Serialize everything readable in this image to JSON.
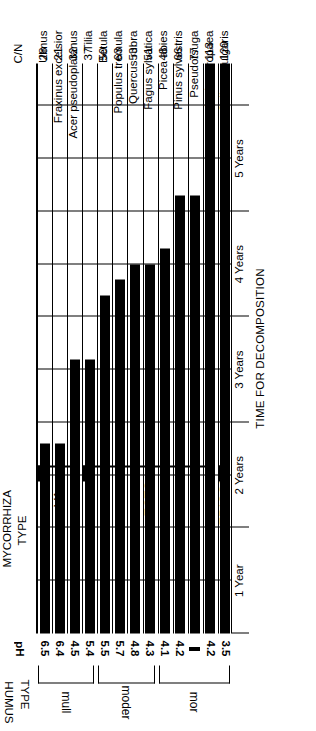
{
  "figure": {
    "humus_header_line1": "HUMUS",
    "humus_header_line2": "TYPE",
    "ph_header": "pH",
    "cn_header": "C/N",
    "mycorrhiza_header_line1": "MYCORRHIZA",
    "mycorrhiza_header_line2": "TYPE",
    "axis_title": "TIME FOR DECOMPOSITION"
  },
  "axis": {
    "ticks": [
      "1 Year",
      "2 Years",
      "3 Years",
      "4 Years",
      "5 Years"
    ],
    "min": 0,
    "max": 5,
    "unit": "Years"
  },
  "humus_groups": [
    {
      "label": "mull",
      "first": 0,
      "last": 3
    },
    {
      "label": "moder",
      "first": 4,
      "last": 7
    },
    {
      "label": "mor",
      "first": 8,
      "last": 12
    }
  ],
  "mycorrhiza_groups": [
    {
      "label": "VA",
      "first": 0,
      "last": 2
    },
    {
      "label": "ECTO",
      "first": 3,
      "last": 11
    },
    {
      "label": "ERICOID",
      "first": 12,
      "last": 12
    }
  ],
  "chart_data": {
    "type": "bar",
    "orientation": "horizontal",
    "title": "",
    "xlabel": "TIME FOR DECOMPOSITION",
    "ylabel": "",
    "xlim": [
      0,
      5.4
    ],
    "grid": true,
    "legend": "none",
    "categories": [
      "Ulmus",
      "Fraxinus excelsior",
      "Acer pseudoplatanus",
      "Tilia",
      "Betula",
      "Populus tremula",
      "Quercus rubra",
      "Fagus sylvatica",
      "Picea abies",
      "Pinus sylvestris",
      "Pseudotsuga",
      "Larix europaea",
      "Calluna vulgaris"
    ],
    "values": [
      1.8,
      1.8,
      2.6,
      2.6,
      3.2,
      3.35,
      3.5,
      3.5,
      3.65,
      4.15,
      4.15,
      5.4,
      5.4
    ],
    "series": [
      {
        "name": "Time for decomposition (years)",
        "values": [
          1.8,
          1.8,
          2.6,
          2.6,
          3.2,
          3.35,
          3.5,
          3.5,
          3.65,
          4.15,
          4.15,
          5.4,
          5.4
        ]
      }
    ],
    "cn_ratio": [
      28,
      21,
      32,
      37,
      50,
      63,
      53,
      51,
      48,
      66,
      77,
      113,
      120
    ],
    "ph": [
      "6.5",
      "6.4",
      "4.5",
      "5.4",
      "5.5",
      "5.7",
      "4.8",
      "4.3",
      "4.1",
      "4.2",
      "–",
      "4.2",
      "3.5"
    ],
    "humus_type": [
      "mull",
      "mull",
      "mull",
      "mull",
      "moder",
      "moder",
      "moder",
      "moder",
      "mor",
      "mor",
      "mor",
      "mor",
      "mor"
    ],
    "mycorrhiza_type": [
      "VA",
      "VA",
      "VA",
      "ECTO",
      "ECTO",
      "ECTO",
      "ECTO",
      "ECTO",
      "ECTO",
      "ECTO",
      "ECTO",
      "ECTO",
      "ERICOID"
    ],
    "rows": [
      {
        "species": "Ulmus",
        "cn": 28,
        "ph": "6.5",
        "years": 1.8,
        "humus": "mull",
        "mycorrhiza": "VA"
      },
      {
        "species": "Fraxinus excelsior",
        "cn": 21,
        "ph": "6.4",
        "years": 1.8,
        "humus": "mull",
        "mycorrhiza": "VA"
      },
      {
        "species": "Acer pseudoplatanus",
        "cn": 32,
        "ph": "4.5",
        "years": 2.6,
        "humus": "mull",
        "mycorrhiza": "VA"
      },
      {
        "species": "Tilia",
        "cn": 37,
        "ph": "5.4",
        "years": 2.6,
        "humus": "mull",
        "mycorrhiza": "ECTO"
      },
      {
        "species": "Betula",
        "cn": 50,
        "ph": "5.5",
        "years": 3.2,
        "humus": "moder",
        "mycorrhiza": "ECTO"
      },
      {
        "species": "Populus tremula",
        "cn": 63,
        "ph": "5.7",
        "years": 3.35,
        "humus": "moder",
        "mycorrhiza": "ECTO"
      },
      {
        "species": "Quercus rubra",
        "cn": 53,
        "ph": "4.8",
        "years": 3.5,
        "humus": "moder",
        "mycorrhiza": "ECTO"
      },
      {
        "species": "Fagus sylvatica",
        "cn": 51,
        "ph": "4.3",
        "years": 3.5,
        "humus": "moder",
        "mycorrhiza": "ECTO"
      },
      {
        "species": "Picea abies",
        "cn": 48,
        "ph": "4.1",
        "years": 3.65,
        "humus": "mor",
        "mycorrhiza": "ECTO"
      },
      {
        "species": "Pinus sylvestris",
        "cn": 66,
        "ph": "4.2",
        "years": 4.15,
        "humus": "mor",
        "mycorrhiza": "ECTO"
      },
      {
        "species": "Pseudotsuga",
        "cn": 77,
        "ph": "–",
        "years": 4.15,
        "humus": "mor",
        "mycorrhiza": "ECTO"
      },
      {
        "species": "Larix europaea",
        "cn": 113,
        "ph": "4.2",
        "years": 5.4,
        "humus": "mor",
        "mycorrhiza": "ECTO"
      },
      {
        "species": "Calluna vulgaris",
        "cn": 120,
        "ph": "3.5",
        "years": 5.4,
        "humus": "mor",
        "mycorrhiza": "ERICOID"
      }
    ]
  }
}
